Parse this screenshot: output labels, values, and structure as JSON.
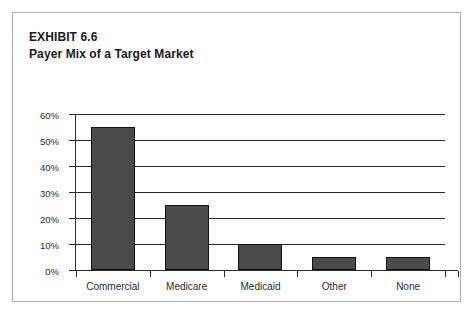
{
  "exhibit": {
    "title_line_1": "EXHIBIT 6.6",
    "title_line_2": "Payer Mix of a Target Market",
    "border_color": "#b0b0b0",
    "background": "#ffffff"
  },
  "chart_data": {
    "type": "bar",
    "title": "Payer Mix of a Target Market",
    "subtitle": "EXHIBIT 6.6",
    "categories": [
      "Commercial",
      "Medicare",
      "Medicaid",
      "Other",
      "None"
    ],
    "values": [
      55,
      25,
      10,
      5,
      5
    ],
    "value_labels": [
      "55%",
      "25%",
      "10%",
      "5%",
      "5%"
    ],
    "xlabel": "",
    "ylabel": "",
    "ylim": [
      0,
      60
    ],
    "ytick_values": [
      0,
      10,
      20,
      30,
      40,
      50,
      60
    ],
    "ytick_labels": [
      "0%",
      "10%",
      "20%",
      "30%",
      "40%",
      "50%",
      "60%"
    ],
    "grid": true,
    "legend": false,
    "bar_color": "#4a4a4a",
    "bar_border_color": "#111111",
    "axis_color": "#2b2b2b"
  }
}
